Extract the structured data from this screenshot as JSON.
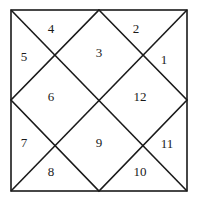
{
  "diagram": {
    "type": "north-indian-house-chart",
    "line_color": "#1a1a1a",
    "background": "#ffffff",
    "houses": [
      {
        "id": "house-1",
        "label": "1"
      },
      {
        "id": "house-2",
        "label": "2"
      },
      {
        "id": "house-3",
        "label": "3"
      },
      {
        "id": "house-4",
        "label": "4"
      },
      {
        "id": "house-5",
        "label": "5"
      },
      {
        "id": "house-6",
        "label": "6"
      },
      {
        "id": "house-7",
        "label": "7"
      },
      {
        "id": "house-8",
        "label": "8"
      },
      {
        "id": "house-9",
        "label": "9"
      },
      {
        "id": "house-10",
        "label": "10"
      },
      {
        "id": "house-11",
        "label": "11"
      },
      {
        "id": "house-12",
        "label": "12"
      }
    ]
  }
}
